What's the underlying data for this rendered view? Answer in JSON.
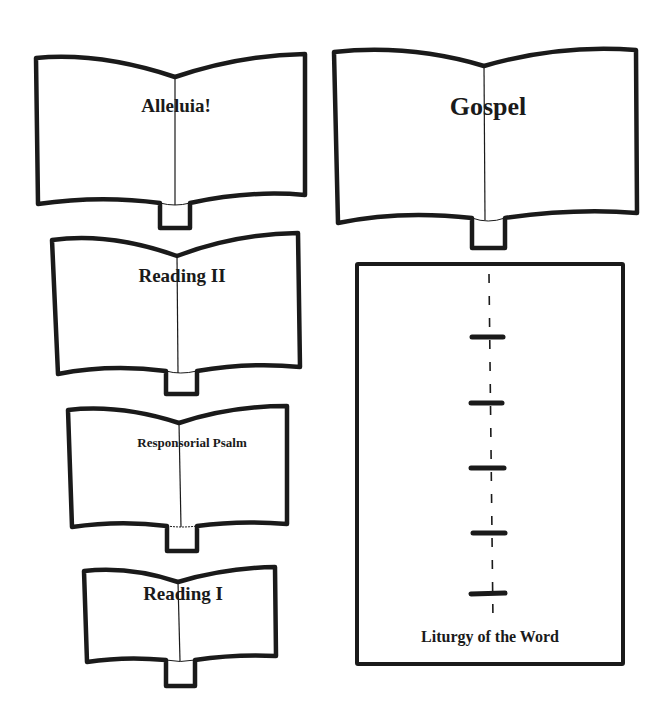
{
  "diagram": {
    "colors": {
      "ink": "#1a1a1a",
      "background": "#ffffff"
    },
    "books": [
      {
        "id": "alleluia",
        "label": "Alleluia!"
      },
      {
        "id": "gospel",
        "label": "Gospel"
      },
      {
        "id": "reading-2",
        "label": "Reading  II"
      },
      {
        "id": "responsorial-psalm",
        "label": "Responsorial Psalm"
      },
      {
        "id": "reading-1",
        "label": "Reading  I"
      }
    ],
    "liturgy": {
      "label": "Liturgy of the Word",
      "steps_count": 5,
      "icon": "dashed-timeline-with-markers"
    }
  }
}
